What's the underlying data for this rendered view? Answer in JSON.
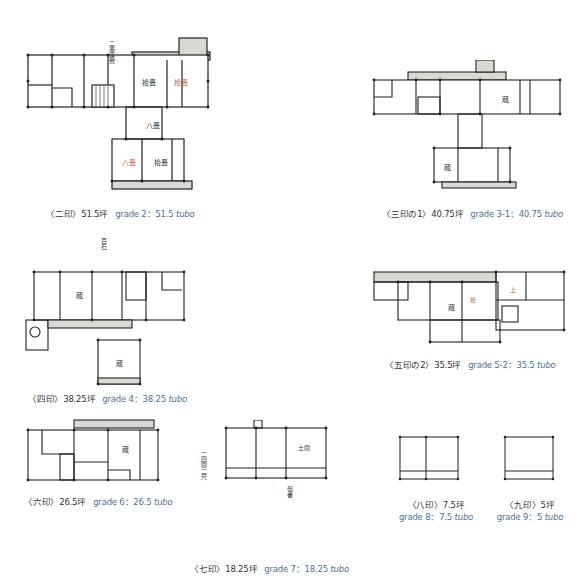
{
  "plans": [
    {
      "id": "grade2",
      "jp": "〈二印〉51.5坪",
      "en_prefix": "grade 2：51.5 ",
      "en_unit": "tubo",
      "tsubo": 51.5
    },
    {
      "id": "grade3-1",
      "jp": "〈三印の1〉40.75坪",
      "en_prefix": "grade 3-1：40.75 ",
      "en_unit": "tubo",
      "tsubo": 40.75
    },
    {
      "id": "grade4",
      "jp": "〈四印〉38.25坪",
      "en_prefix": "grade 4：38.25 ",
      "en_unit": "tubo",
      "tsubo": 38.25
    },
    {
      "id": "grade5-2",
      "jp": "〈五印の2〉35.5坪",
      "en_prefix": "grade 5-2：35.5 ",
      "en_unit": "tubo",
      "tsubo": 35.5
    },
    {
      "id": "grade6",
      "jp": "〈六印〉26.5坪",
      "en_prefix": "grade 6：26.5 ",
      "en_unit": "tubo",
      "tsubo": 26.5
    },
    {
      "id": "grade7",
      "jp": "〈七印〉18.25坪",
      "en_prefix": "grade 7：18.25 ",
      "en_unit": "tubo",
      "tsubo": 18.25
    },
    {
      "id": "grade8",
      "jp": "〈八印〉7.5坪",
      "en_prefix": "grade 8：7.5 ",
      "en_unit": "tubo",
      "tsubo": 7.5
    },
    {
      "id": "grade9",
      "jp": "〈九印〉5坪",
      "en_prefix": "grade 9：5 ",
      "en_unit": "tubo",
      "tsubo": 5
    }
  ],
  "annotations": {
    "g2_top": "二番 座敷",
    "g2_room1": "拾畳",
    "g2_room2": "拾畳",
    "g2_room3": "八畳",
    "g2_room4": "八畳",
    "g2_room5": "拾畳",
    "room_mark": "蔵",
    "g7_room": "土間"
  },
  "colors": {
    "caption_en": "#4a6fa5",
    "caption_jp": "#333333",
    "line": "#222222",
    "corridor": "#d9d9d4",
    "red_note": "#d2603a"
  }
}
